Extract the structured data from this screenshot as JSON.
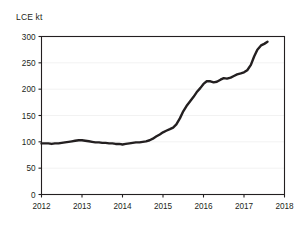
{
  "chart_data": {
    "type": "line",
    "title": "",
    "subtitle": "",
    "xlabel": "",
    "ylabel": "LCE kt",
    "ylabel_position": "above-axis",
    "xlim": [
      2012,
      2018
    ],
    "ylim": [
      0,
      300
    ],
    "y_ticks": [
      0,
      50,
      100,
      150,
      200,
      250,
      300
    ],
    "x_ticks": [
      2012,
      2013,
      2014,
      2015,
      2016,
      2017,
      2018
    ],
    "y_tick_labels": [
      "0",
      "50",
      "100",
      "150",
      "200",
      "250",
      "300"
    ],
    "x_tick_labels": [
      "2012",
      "2013",
      "2014",
      "2015",
      "2016",
      "2017",
      "2018"
    ],
    "grid": "horizontal-faint",
    "legend": "none",
    "line_color": "#231f20",
    "line_width_px": 2.4,
    "axis_color": "#231f20",
    "grid_color": "#f2f2f2",
    "background_color": "#ffffff",
    "series": [
      {
        "name": "LCE kt",
        "x": [
          2012.0,
          2012.08,
          2012.17,
          2012.25,
          2012.33,
          2012.42,
          2012.5,
          2012.58,
          2012.67,
          2012.75,
          2012.83,
          2012.92,
          2013.0,
          2013.08,
          2013.17,
          2013.25,
          2013.33,
          2013.42,
          2013.5,
          2013.58,
          2013.67,
          2013.75,
          2013.83,
          2013.92,
          2014.0,
          2014.08,
          2014.17,
          2014.25,
          2014.33,
          2014.42,
          2014.5,
          2014.58,
          2014.67,
          2014.75,
          2014.83,
          2014.92,
          2015.0,
          2015.08,
          2015.17,
          2015.25,
          2015.33,
          2015.42,
          2015.5,
          2015.58,
          2015.67,
          2015.75,
          2015.83,
          2015.92,
          2016.0,
          2016.08,
          2016.17,
          2016.25,
          2016.33,
          2016.42,
          2016.5,
          2016.58,
          2016.67,
          2016.75,
          2016.83,
          2016.92,
          2017.0,
          2017.08,
          2017.17,
          2017.25,
          2017.33,
          2017.42,
          2017.5,
          2017.58
        ],
        "values": [
          97,
          97,
          97,
          96,
          97,
          97,
          98,
          99,
          100,
          101,
          102,
          103,
          103,
          102,
          101,
          100,
          99,
          99,
          98,
          98,
          97,
          97,
          96,
          96,
          95,
          96,
          97,
          98,
          99,
          99,
          100,
          101,
          103,
          106,
          110,
          114,
          118,
          121,
          124,
          127,
          133,
          145,
          158,
          168,
          177,
          185,
          194,
          202,
          210,
          215,
          215,
          213,
          214,
          218,
          221,
          220,
          222,
          225,
          228,
          230,
          232,
          236,
          246,
          262,
          275,
          283,
          286,
          290
        ]
      }
    ],
    "annotations": []
  },
  "axis": {
    "y_title": "LCE kt"
  }
}
